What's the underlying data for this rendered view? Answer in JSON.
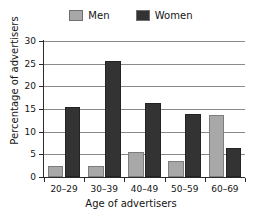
{
  "chart_data": {
    "type": "bar",
    "title": "",
    "xlabel": "Age of advertisers",
    "ylabel": "Percentage of advertisers",
    "categories": [
      "20–29",
      "30–39",
      "40–49",
      "50–59",
      "60–69"
    ],
    "series": [
      {
        "name": "Men",
        "color": "#a8a8a8",
        "values": [
          2.5,
          2.5,
          5.6,
          3.5,
          13.6
        ]
      },
      {
        "name": "Women",
        "color": "#333333",
        "values": [
          15.5,
          25.7,
          16.3,
          13.8,
          6.5
        ]
      }
    ],
    "ylim": [
      0,
      30
    ],
    "yticks": [
      0,
      5,
      10,
      15,
      20,
      25,
      30
    ],
    "ytick_labels": [
      "0",
      "5",
      "10",
      "15",
      "20",
      "25",
      "30"
    ],
    "grid": "horizontal",
    "legend_position": "top-center"
  },
  "legend": {
    "entries": [
      {
        "label": "Men",
        "swatch": "men-swatch"
      },
      {
        "label": "Women",
        "swatch": "women-swatch"
      }
    ]
  }
}
